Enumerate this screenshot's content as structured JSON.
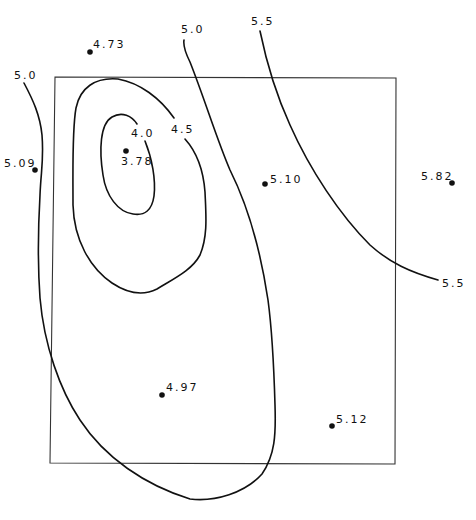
{
  "diagram": {
    "type": "contour-map",
    "frame": {
      "corners": [
        [
          55,
          77
        ],
        [
          396,
          78
        ],
        [
          395,
          464
        ],
        [
          50,
          463
        ]
      ]
    },
    "contour_labels": [
      {
        "id": "c50-left",
        "text": "5.0",
        "x": 14,
        "y": 79
      },
      {
        "id": "c50-top",
        "text": "5.0",
        "x": 181,
        "y": 33
      },
      {
        "id": "c55-top",
        "text": "5.5",
        "x": 251,
        "y": 25
      },
      {
        "id": "c40",
        "text": "4.0",
        "x": 131,
        "y": 137
      },
      {
        "id": "c45",
        "text": "4.5",
        "x": 171,
        "y": 133
      },
      {
        "id": "c55-right",
        "text": "5.5",
        "x": 442,
        "y": 287
      }
    ],
    "data_points": [
      {
        "value": "4.73",
        "x": 90,
        "y": 52,
        "lx": 93,
        "ly": 48
      },
      {
        "value": "5.09",
        "x": 35,
        "y": 170,
        "lx": 4,
        "ly": 167
      },
      {
        "value": "3.78",
        "x": 126,
        "y": 151,
        "lx": 121,
        "ly": 165
      },
      {
        "value": "5.10",
        "x": 265,
        "y": 184,
        "lx": 270,
        "ly": 183
      },
      {
        "value": "5.82",
        "x": 452,
        "y": 183,
        "lx": 421,
        "ly": 180
      },
      {
        "value": "4.97",
        "x": 162,
        "y": 395,
        "lx": 166,
        "ly": 391
      },
      {
        "value": "5.12",
        "x": 332,
        "y": 426,
        "lx": 336,
        "ly": 423
      }
    ],
    "contours": [
      {
        "level": "4.0",
        "closed": true
      },
      {
        "level": "4.5",
        "closed": true
      },
      {
        "level": "5.0",
        "closed": false
      },
      {
        "level": "5.5",
        "closed": false
      }
    ]
  }
}
